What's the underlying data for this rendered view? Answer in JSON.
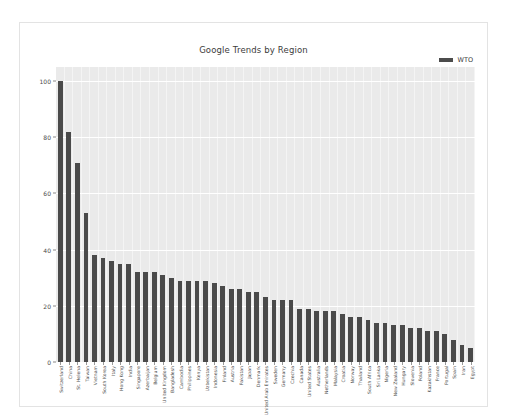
{
  "card": {
    "caption": ""
  },
  "legend": {
    "position": "top-right",
    "entries": [
      {
        "label": "WTO",
        "color": "#4c4c4c"
      }
    ]
  },
  "axis": {
    "y_ticks": [
      "0",
      "20",
      "40",
      "60",
      "80",
      "100"
    ]
  },
  "chart_data": {
    "type": "bar",
    "title": "Google Trends by Region",
    "xlabel": "",
    "ylabel": "",
    "ylim": [
      0,
      105
    ],
    "grid": true,
    "legend_position": "top-right",
    "series_name": "WTO",
    "bar_color": "#4a4a4a",
    "categories": [
      "Switzerland",
      "China",
      "St. Helena",
      "Taiwan",
      "Vietnam",
      "South Korea",
      "Italy",
      "Hong Kong",
      "India",
      "Singapore",
      "Azerbaijan",
      "Belgium",
      "United Kingdom",
      "Bangladesh",
      "Cambodia",
      "Philippines",
      "Kenya",
      "Uzbekistan",
      "Indonesia",
      "Finland",
      "Austria",
      "Pakistan",
      "Japan",
      "Denmark",
      "United Arab Emirates",
      "Sweden",
      "Germany",
      "Czechia",
      "Canada",
      "United States",
      "Australia",
      "Netherlands",
      "Malaysia",
      "Croatia",
      "Norway",
      "Thailand",
      "South Africa",
      "Sri Lanka",
      "Nigeria",
      "New Zealand",
      "Hungary",
      "Slovenia",
      "Poland",
      "Kazakhstan",
      "France",
      "Portugal",
      "Spain",
      "Iran",
      "Egypt"
    ],
    "values": [
      100,
      82,
      71,
      53,
      38,
      37,
      36,
      35,
      35,
      32,
      32,
      32,
      31,
      30,
      29,
      29,
      29,
      29,
      28,
      27,
      26,
      26,
      25,
      25,
      23,
      22,
      22,
      22,
      19,
      19,
      18,
      18,
      18,
      17,
      16,
      16,
      15,
      14,
      14,
      13,
      13,
      12,
      12,
      11,
      11,
      10,
      8,
      6,
      5
    ]
  }
}
